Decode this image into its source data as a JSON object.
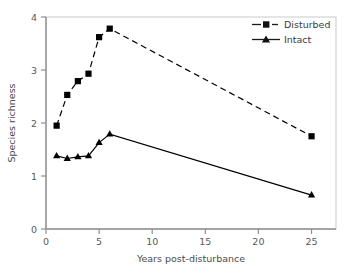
{
  "chart_data": {
    "type": "line",
    "title": "",
    "xlabel": "Years post-disturbance",
    "ylabel": "Species richness",
    "xlim": [
      0,
      27.3
    ],
    "ylim": [
      0,
      4
    ],
    "xticks": [
      0,
      5,
      10,
      15,
      20,
      25
    ],
    "xtick_labels": [
      "0",
      "5",
      "10",
      "15",
      "20",
      "25"
    ],
    "yticks": [
      0,
      1,
      2,
      3,
      4
    ],
    "ytick_labels": [
      "0",
      "1",
      "2",
      "3",
      "4"
    ],
    "grid": false,
    "legend_position": "top-right",
    "series": [
      {
        "name": "Disturbed",
        "marker": "square",
        "linestyle": "dashed",
        "color": "#000000",
        "x": [
          1,
          2,
          3,
          4,
          5,
          6,
          25
        ],
        "values": [
          1.95,
          2.53,
          2.79,
          2.93,
          3.62,
          3.78,
          1.75
        ]
      },
      {
        "name": "Intact",
        "marker": "triangle",
        "linestyle": "solid",
        "color": "#000000",
        "x": [
          1,
          2,
          3,
          4,
          5,
          6,
          25
        ],
        "values": [
          1.38,
          1.33,
          1.36,
          1.38,
          1.63,
          1.79,
          0.64
        ]
      }
    ]
  },
  "legend": {
    "entries": [
      {
        "label": "Disturbed"
      },
      {
        "label": "Intact"
      }
    ]
  },
  "axes": {
    "x_title": "Years post-disturbance",
    "y_title": "Species richness",
    "x_tick_0": "0",
    "x_tick_1": "5",
    "x_tick_2": "10",
    "x_tick_3": "15",
    "x_tick_4": "20",
    "x_tick_5": "25",
    "y_tick_0": "0",
    "y_tick_1": "1",
    "y_tick_2": "2",
    "y_tick_3": "3",
    "y_tick_4": "4"
  },
  "colors": {
    "line": "#1a1a1a",
    "axis": "#9a9a9a",
    "frame": "#c8c8c8",
    "text": "#4a4a4a",
    "background": "#ffffff"
  }
}
